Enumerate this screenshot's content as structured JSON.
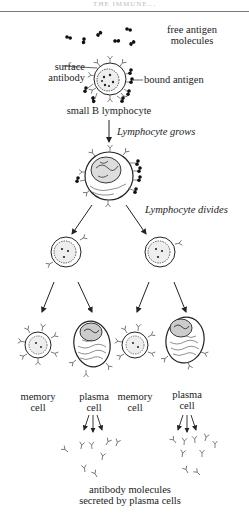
{
  "header": {
    "running_head": "THE IMMUNE..."
  },
  "labels": {
    "free_antigen": [
      "free antigen",
      "molecules"
    ],
    "surface_antibody": [
      "surface",
      "antibody"
    ],
    "bound_antigen": "bound antigen",
    "small_b_lymphocyte": "small B lymphocyte",
    "lymphocyte_grows": "Lymphocyte grows",
    "lymphocyte_divides": "Lymphocyte divides",
    "memory_cell_left": [
      "memory",
      "cell"
    ],
    "plasma_cell_left": [
      "plasma",
      "cell"
    ],
    "memory_cell_right": [
      "memory",
      "cell"
    ],
    "plasma_cell_right": [
      "plasma",
      "cell"
    ],
    "antibody_molecules": [
      "antibody molecules",
      "secreted by plasma cells"
    ]
  },
  "colors": {
    "ink": "#222222",
    "rule": "#777777",
    "antibody": "#666666"
  }
}
